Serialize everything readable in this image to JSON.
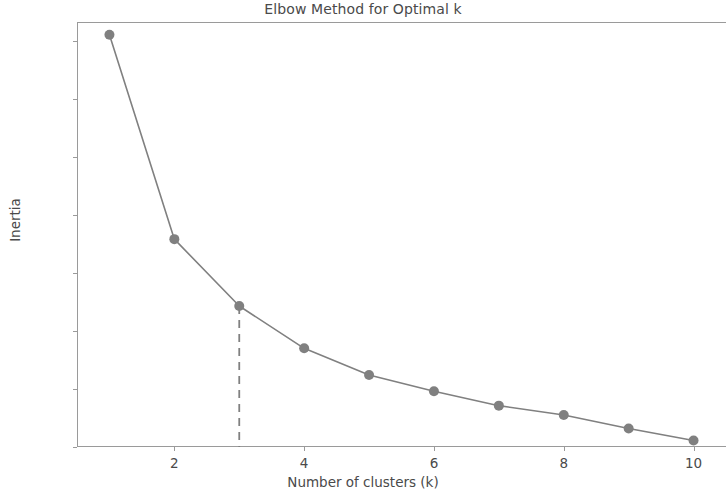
{
  "chart_data": {
    "type": "line",
    "title": "Elbow Method for Optimal k",
    "xlabel": "Number of clusters (k)",
    "ylabel": "Inertia",
    "x": [
      1,
      2,
      3,
      4,
      5,
      6,
      7,
      8,
      9,
      10
    ],
    "values": [
      2275,
      1395,
      1107,
      925,
      810,
      740,
      678,
      638,
      580,
      528
    ],
    "series": [
      {
        "name": "Inertia",
        "x": [
          1,
          2,
          3,
          4,
          5,
          6,
          7,
          8,
          9,
          10
        ],
        "values": [
          2275,
          1395,
          1107,
          925,
          810,
          740,
          678,
          638,
          580,
          528
        ],
        "color": "#808080",
        "marker": "circle",
        "linestyle": "solid"
      }
    ],
    "annotations": [
      {
        "type": "vertical-dashed-line",
        "label": "elbow at k=3",
        "x": 3,
        "y_top": 1107,
        "y_bottom": 500,
        "color": "#808080",
        "linestyle": "dashed"
      }
    ],
    "xlim": [
      0.5,
      10.5
    ],
    "ylim": [
      500,
      2330
    ],
    "xticks": [
      2,
      4,
      6,
      8,
      10
    ],
    "xtick_labels": [
      "2",
      "4",
      "6",
      "8",
      "10"
    ],
    "yticks": [
      500,
      750,
      1000,
      1250,
      1500,
      1750,
      2000,
      2250
    ],
    "ytick_labels": [
      "500",
      "750",
      "1000",
      "1250",
      "1500",
      "1750",
      "2000",
      "2250"
    ],
    "grid": false,
    "legend": null,
    "legend_position": "none",
    "colors": {
      "line": "#808080",
      "marker": "#808080",
      "axis": "#9a9a9a",
      "text": "#4a4a4a",
      "background": "#ffffff"
    }
  }
}
